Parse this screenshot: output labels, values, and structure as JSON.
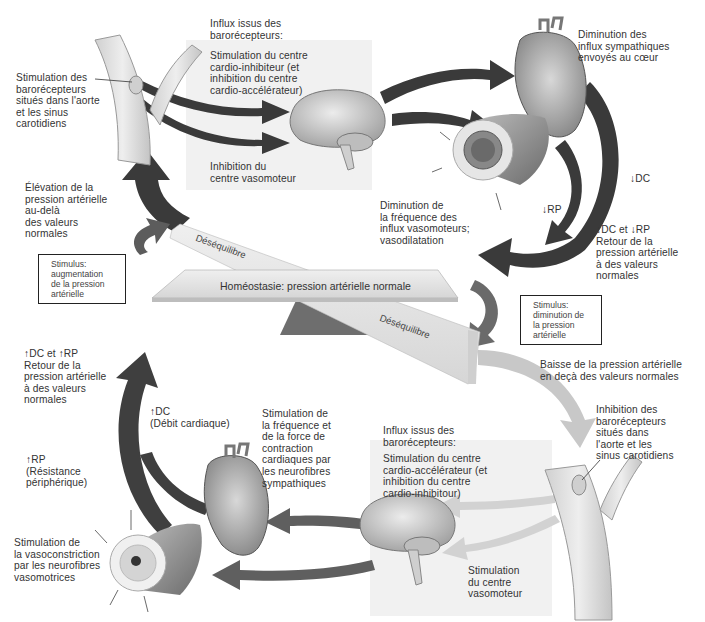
{
  "diagram": {
    "title": "Homéostasie: pression artérielle normale",
    "seesaw": {
      "center_label": "Homéostasie: pression artérielle normale",
      "left_tilt_label": "Déséquilibre",
      "right_tilt_label": "Déséquilibre"
    },
    "upper_loop": {
      "stimulus_box": "Stimulus:\naugmentation\nde la pression\nartérielle",
      "rise_label": "Élévation de la\npression artérielle\nau-delà\ndes valeurs\nnormales",
      "baroreceptor_label": "Stimulation des\nbarorécepteurs\nsitués dans l'aorte\net les sinus\ncarotidiens",
      "influx_header": "Influx issus des\nbarorécepteurs:",
      "cardio_label": "Stimulation du centre\ncardio-inhibiteur (et\ninhibition du centre\ncardio-accélérateur)",
      "vasomotor_label": "Inhibition du\ncentre vasomoteur",
      "heart_label": "Diminution des\ninflux sympathiques\nenvoyés au cœur",
      "vessel_label": "Diminution de\nla fréquence des\ninflux vasomoteurs;\nvasodilatation",
      "dc_label": "↓DC",
      "rp_label": "↓RP",
      "return_label": "↓DC et ↓RP\nRetour de la\npression artérielle\nà des valeurs\nnormales"
    },
    "lower_loop": {
      "stimulus_box": "Stimulus:\ndiminution de\nla pression\nartérielle",
      "drop_label": "Baisse de la pression artérielle\nen deçà des valeurs normales",
      "baroreceptor_label": "Inhibition des\nbarorécepteurs\nsitués dans\nl'aorte et les\nsinus carotidiens",
      "influx_header": "Influx issus des\nbarorécepteurs:",
      "cardio_label": "Stimulation du centre\ncardio-accélérateur (et\ninhibition du centre\ncardio-inhibitour)",
      "vasomotor_label": "Stimulation\ndu centre\nvasomoteur",
      "heart_label": "Stimulation de\nla fréquence et\nde la force de\ncontraction\ncardiaques par\nles neurofibres\nsympathiques",
      "vessel_label": "Stimulation de\nla vasoconstriction\npar les neurofibres\nvasomotrices",
      "dc_label": "↑DC\n(Débit cardiaque)",
      "rp_label": "↑RP\n(Résistance\npériphérique)",
      "return_label": "↑DC et ↑RP\nRetour de la\npression artérielle\nà des valeurs\nnormales"
    },
    "colors": {
      "dark_arrow": "#3a3a3a",
      "medium_arrow": "#5c5c5c",
      "light_arrow": "#c8c8c8",
      "panel": "#f1f1f1",
      "beam": "#e4e4e4",
      "fulcrum": "#6e6e6e"
    }
  }
}
